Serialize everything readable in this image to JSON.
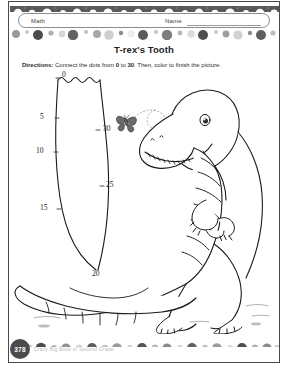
{
  "page": {
    "background_color": "#ffffff",
    "frame_color": "#4a4a4a",
    "width": 288,
    "height": 373
  },
  "header": {
    "subject_label": "Math",
    "name_label": "Name",
    "name_field_value": "",
    "name_field_placeholder": ""
  },
  "title": "T-rex's Tooth",
  "directions": {
    "lead": "Directions:",
    "text_part1": " Connect the dots from ",
    "start_number": "0",
    "text_part2": " to ",
    "end_number": "30",
    "text_part3": ". Then, color to finish the picture."
  },
  "activity": {
    "type": "connect-the-dots",
    "start": 0,
    "end": 30,
    "step": 5,
    "shape_name": "t-rex-tooth",
    "dot_labels": [
      {
        "label": "0",
        "x": 52,
        "y": 78
      },
      {
        "label": "5",
        "x": 50,
        "y": 117
      },
      {
        "label": "10",
        "x": 44,
        "y": 151
      },
      {
        "label": "15",
        "x": 52,
        "y": 208
      },
      {
        "label": "20",
        "x": 90,
        "y": 269
      },
      {
        "label": "25",
        "x": 90,
        "y": 184
      },
      {
        "label": "30",
        "x": 88,
        "y": 127
      }
    ]
  },
  "illustration": {
    "subject": "t-rex-dinosaur",
    "elements": [
      "t-rex-head",
      "t-rex-eye",
      "t-rex-nostril",
      "t-rex-teeth",
      "t-rex-striped-belly",
      "t-rex-arms",
      "t-rex-legs",
      "t-rex-clawed-feet",
      "t-rex-tail",
      "butterfly",
      "butterfly-flight-trail",
      "ground-marks"
    ]
  },
  "footer": {
    "page_number": "378",
    "credit": "Crazy Big Book of Second Grade"
  },
  "decor": {
    "band_colors": [
      "#4b4b4b",
      "#6e6e6e",
      "#9a9a9a",
      "#bdbdbd",
      "#d6d6d6",
      "#8a8a8a"
    ]
  }
}
